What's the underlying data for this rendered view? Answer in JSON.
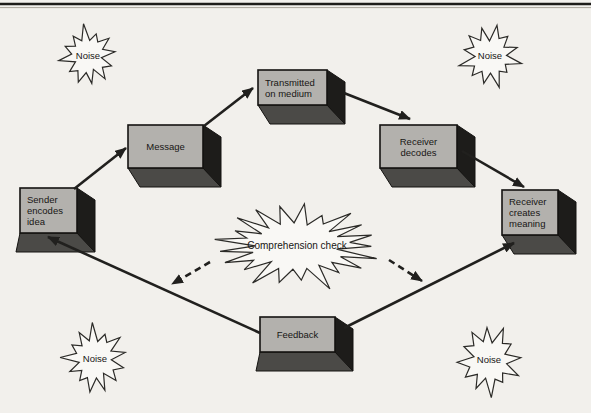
{
  "page": {
    "background": "#f2f0ec",
    "top_rule_color": "#1d1c1a",
    "top_rule_shadow": "#aba69c"
  },
  "colors": {
    "box_front": "#b3b1ad",
    "box_right_side": "#1d1c1a",
    "box_bottom_side": "#4b4a47",
    "box_border": "#141311",
    "arrow_line": "#21201e",
    "burst_fill": "#f9f8f5",
    "burst_stroke": "#2b2a27",
    "label_text": "#171614"
  },
  "diagram": {
    "nodes": [
      {
        "id": "sender-encodes-idea",
        "lines": [
          "Sender",
          "encodes",
          "idea"
        ],
        "x": 20,
        "y": 188,
        "w": 57,
        "h": 45,
        "align": "left",
        "skew": "left"
      },
      {
        "id": "message",
        "lines": [
          "Message"
        ],
        "x": 128,
        "y": 125,
        "w": 75,
        "h": 43,
        "align": "center",
        "skew": "right"
      },
      {
        "id": "transmitted-on-medium",
        "lines": [
          "Transmitted",
          "on medium"
        ],
        "x": 258,
        "y": 70,
        "w": 69,
        "h": 35,
        "align": "left",
        "skew": "right"
      },
      {
        "id": "receiver-decodes",
        "lines": [
          "Receiver",
          "decodes"
        ],
        "x": 380,
        "y": 125,
        "w": 77,
        "h": 43,
        "align": "center",
        "skew": "right"
      },
      {
        "id": "receiver-creates-meaning",
        "lines": [
          "Receiver",
          "creates",
          "meaning"
        ],
        "x": 502,
        "y": 190,
        "w": 56,
        "h": 45,
        "align": "left",
        "skew": "right"
      },
      {
        "id": "feedback",
        "lines": [
          "Feedback"
        ],
        "x": 260,
        "y": 317,
        "w": 75,
        "h": 35,
        "align": "center",
        "skew": "left"
      }
    ],
    "edges": [
      {
        "id": "sender-to-message",
        "from": [
          74,
          189
        ],
        "to": [
          126,
          148
        ],
        "style": "solid"
      },
      {
        "id": "message-to-transmitted",
        "from": [
          204,
          126
        ],
        "to": [
          253,
          88
        ],
        "style": "solid"
      },
      {
        "id": "transmitted-to-receiver-decodes",
        "from": [
          344,
          93
        ],
        "to": [
          410,
          119
        ],
        "style": "solid"
      },
      {
        "id": "receiver-decodes-to-receiver-creates",
        "from": [
          462,
          151
        ],
        "to": [
          524,
          187
        ],
        "style": "solid"
      },
      {
        "id": "feedback-to-sender",
        "from": [
          260,
          333
        ],
        "to": [
          48,
          237
        ],
        "style": "solid"
      },
      {
        "id": "feedback-to-receiver-creates",
        "from": [
          344,
          328
        ],
        "to": [
          514,
          243
        ],
        "style": "solid"
      },
      {
        "id": "comprehension-check-to-left-path",
        "from": [
          210,
          262
        ],
        "to": [
          172,
          284
        ],
        "style": "dashed"
      },
      {
        "id": "comprehension-check-to-right-path",
        "from": [
          389,
          260
        ],
        "to": [
          422,
          281
        ],
        "style": "dashed"
      }
    ],
    "bursts": [
      {
        "id": "noise-top-left",
        "label": "Noise",
        "cx": 88,
        "cy": 56,
        "rx": 31,
        "ry": 33,
        "spikes": 12,
        "font": 9.5
      },
      {
        "id": "noise-top-right",
        "label": "Noise",
        "cx": 490,
        "cy": 56,
        "rx": 34,
        "ry": 35,
        "spikes": 12,
        "font": 9.5
      },
      {
        "id": "noise-bottom-left",
        "label": "Noise",
        "cx": 95,
        "cy": 359,
        "rx": 36,
        "ry": 38,
        "spikes": 13,
        "font": 9.5
      },
      {
        "id": "noise-bottom-right",
        "label": "Noise",
        "cx": 489,
        "cy": 360,
        "rx": 36,
        "ry": 39,
        "spikes": 12,
        "font": 9.5
      },
      {
        "id": "comprehension-check",
        "label": "Comprehension check",
        "cx": 297,
        "cy": 246,
        "rx": 93,
        "ry": 46,
        "spikes": 21,
        "font": 10
      }
    ]
  }
}
